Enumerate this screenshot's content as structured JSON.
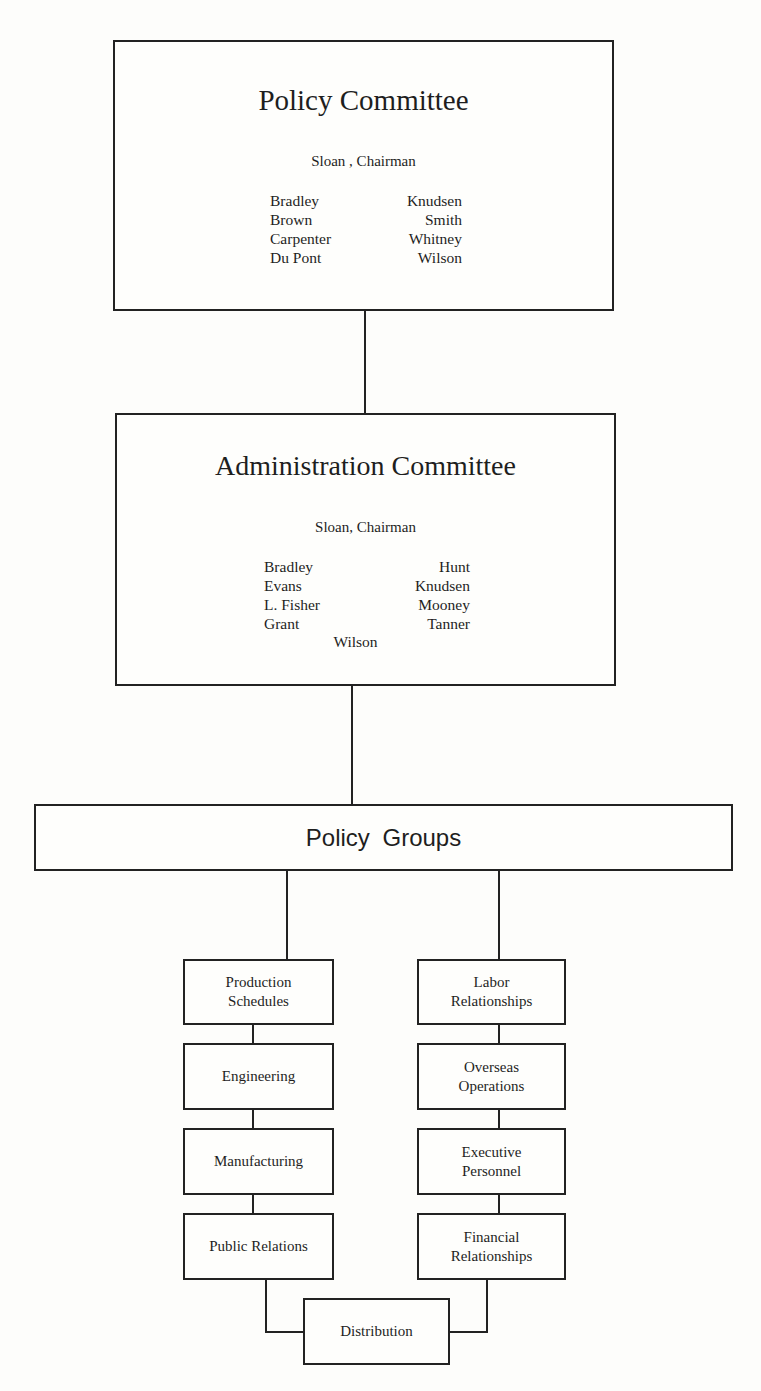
{
  "policy_committee": {
    "title": "Policy Committee",
    "chairman": "Sloan , Chairman",
    "members_left": [
      "Bradley",
      "Brown",
      "Carpenter",
      "Du Pont"
    ],
    "members_right": [
      "Knudsen",
      "Smith",
      "Whitney",
      "Wilson"
    ]
  },
  "administration_committee": {
    "title": "Administration Committee",
    "chairman": "Sloan, Chairman",
    "members_left": [
      "Bradley",
      "Evans",
      "L. Fisher",
      "Grant"
    ],
    "members_right": [
      "Hunt",
      "Knudsen",
      "Mooney",
      "Tanner"
    ],
    "members_center": "Wilson"
  },
  "policy_groups": {
    "title": "Policy Groups",
    "left_column": [
      "Production\nSchedules",
      "Engineering",
      "Manufacturing",
      "Public Relations"
    ],
    "right_column": [
      "Labor\nRelationships",
      "Overseas\nOperations",
      "Executive\nPersonnel",
      "Financial\nRelationships"
    ],
    "bottom": "Distribution"
  }
}
